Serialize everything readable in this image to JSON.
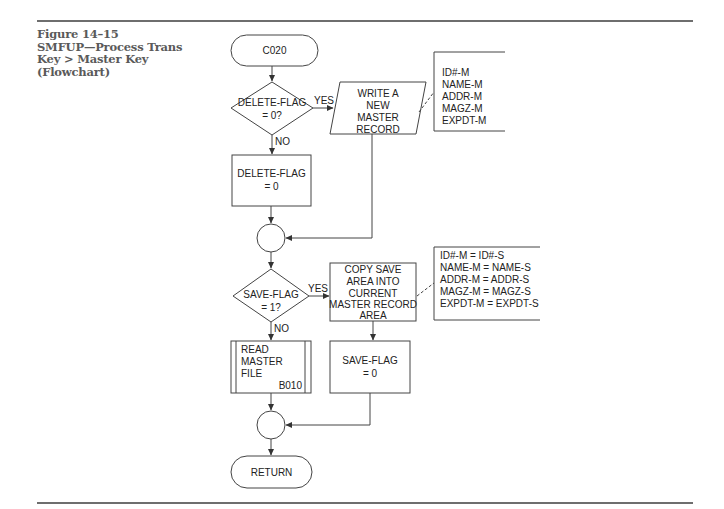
{
  "figure": {
    "number": "Figure 14–15",
    "title_lines": [
      "SMFUP—Process Trans",
      "Key > Master Key",
      "(Flowchart)"
    ]
  },
  "flowchart": {
    "start_terminal": "C020",
    "decision_1": {
      "lines": [
        "DELETE-FLAG",
        "= 0?"
      ],
      "yes_label": "YES",
      "no_label": "NO"
    },
    "io_write": {
      "lines": [
        "WRITE A",
        "NEW",
        "MASTER",
        "RECORD"
      ]
    },
    "annotation_1": {
      "lines": [
        "ID#-M",
        "NAME-M",
        "ADDR-M",
        "MAGZ-M",
        "EXPDT-M"
      ]
    },
    "process_delete_flag": {
      "lines": [
        "DELETE-FLAG",
        "= 0"
      ]
    },
    "decision_2": {
      "lines": [
        "SAVE-FLAG",
        "= 1?"
      ],
      "yes_label": "YES",
      "no_label": "NO"
    },
    "process_copy": {
      "lines": [
        "COPY SAVE",
        "AREA INTO",
        "CURRENT",
        "MASTER RECORD",
        "AREA"
      ]
    },
    "annotation_2": {
      "lines": [
        "ID#-M = ID#-S",
        "NAME-M = NAME-S",
        "ADDR-M = ADDR-S",
        "MAGZ-M = MAGZ-S",
        "EXPDT-M = EXPDT-S"
      ]
    },
    "predefined_read": {
      "lines": [
        "READ",
        "MASTER",
        "FILE"
      ],
      "ref": "B010"
    },
    "process_save_flag": {
      "lines": [
        "SAVE-FLAG",
        "= 0"
      ]
    },
    "end_terminal": "RETURN"
  }
}
